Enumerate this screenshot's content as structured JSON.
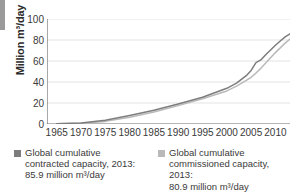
{
  "chart_data": {
    "type": "line",
    "title": "",
    "xlabel": "",
    "ylabel": "Million m³/day",
    "xlim": [
      1963,
      2013
    ],
    "ylim": [
      0,
      100
    ],
    "grid": true,
    "legend_position": "bottom",
    "x_ticks": [
      1965,
      1970,
      1975,
      1980,
      1985,
      1990,
      1995,
      2000,
      2005,
      2010
    ],
    "y_ticks": [
      0,
      20,
      40,
      60,
      80,
      100
    ],
    "x": [
      1965,
      1970,
      1975,
      1980,
      1985,
      1990,
      1995,
      2000,
      2002,
      2004,
      2005,
      2006,
      2007,
      2008,
      2009,
      2010,
      2011,
      2012,
      2013
    ],
    "series": [
      {
        "name": "Global cumulative contracted capacity",
        "color": "#7d7d7d",
        "values": [
          0.3,
          1.0,
          3.5,
          8.0,
          13.0,
          19.0,
          25.5,
          34.0,
          39.0,
          46.0,
          51.0,
          58.5,
          61.0,
          66.0,
          70.5,
          75.0,
          79.0,
          83.0,
          85.9
        ]
      },
      {
        "name": "Global cumulative commissioned capacity",
        "color": "#b9b9b9",
        "values": [
          0.2,
          0.7,
          2.5,
          6.5,
          11.5,
          17.5,
          24.0,
          31.5,
          36.0,
          41.5,
          44.5,
          48.5,
          53.0,
          58.0,
          63.0,
          68.0,
          72.5,
          77.0,
          80.9
        ]
      }
    ]
  },
  "legend": {
    "entries": [
      {
        "swatch_color": "#7d7d7d",
        "line1": "Global cumulative",
        "line2": "contracted capacity, 2013:",
        "line3": "85.9 million m³/day"
      },
      {
        "swatch_color": "#b9b9b9",
        "line1": "Global cumulative",
        "line2": "commissioned capacity, 2013:",
        "line3": "80.9 million m³/day"
      }
    ]
  },
  "colors": {
    "grid": "#dcdcdc",
    "axis": "#6e6e6e",
    "text": "#3a3a3a",
    "edge_bar": "#9a9a9a"
  }
}
